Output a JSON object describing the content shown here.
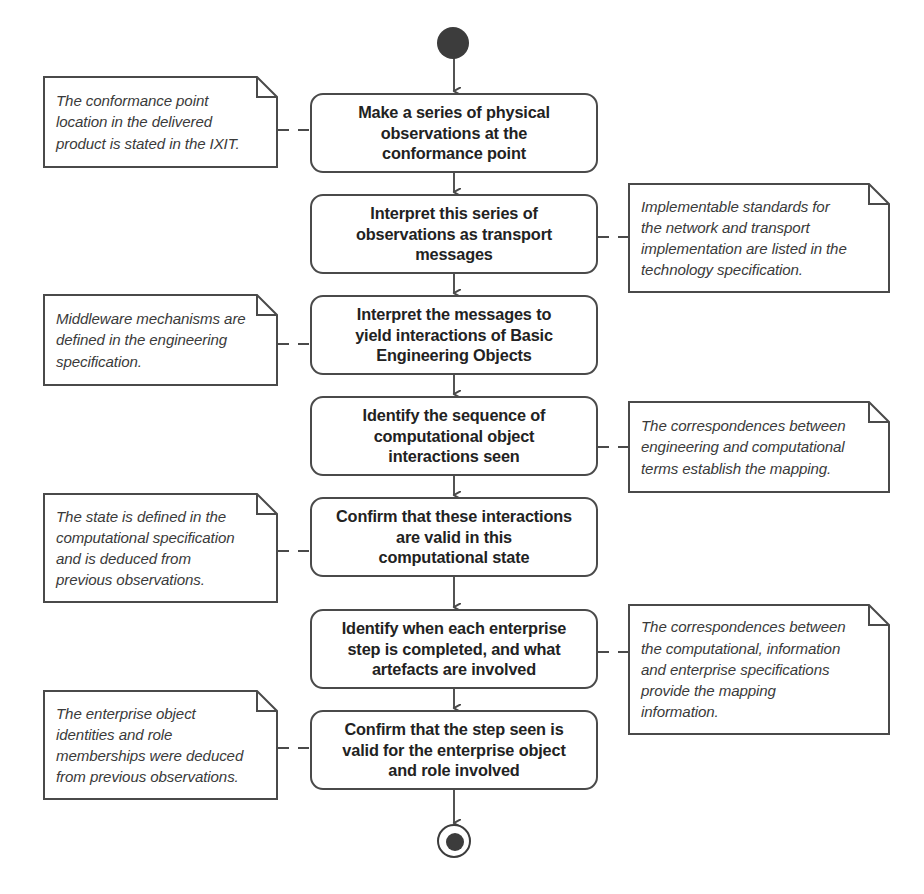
{
  "diagram": {
    "type": "uml-activity-diagram",
    "canvas": {
      "width": 924,
      "height": 894
    },
    "colors": {
      "stroke": "#4a4a4a",
      "text": "#222222",
      "note_text": "#3a3a3a",
      "node_fill": "#3c3c3c",
      "background": "#ffffff"
    },
    "start_node": {
      "name": "initial-node"
    },
    "end_node": {
      "name": "final-node"
    },
    "actions": [
      {
        "id": "action-1",
        "label": "Make a series of physical\nobservations at the\nconformance point",
        "x": 310,
        "y": 93,
        "width": 288,
        "height": 80
      },
      {
        "id": "action-2",
        "label": "Interpret this series of\nobservations as transport\nmessages",
        "x": 310,
        "y": 194,
        "width": 288,
        "height": 80
      },
      {
        "id": "action-3",
        "label": "Interpret the messages to\nyield interactions of Basic\nEngineering Objects",
        "x": 310,
        "y": 295,
        "width": 288,
        "height": 80
      },
      {
        "id": "action-4",
        "label": "Identify the sequence of\ncomputational object\ninteractions seen",
        "x": 310,
        "y": 396,
        "width": 288,
        "height": 80
      },
      {
        "id": "action-5",
        "label": "Confirm that these interactions\nare valid in this\ncomputational state",
        "x": 310,
        "y": 497,
        "width": 288,
        "height": 80
      },
      {
        "id": "action-6",
        "label": "Identify when each enterprise\nstep is completed, and what\nartefacts are involved",
        "x": 310,
        "y": 609,
        "width": 288,
        "height": 80
      },
      {
        "id": "action-7",
        "label": "Confirm that the step seen is\nvalid for the enterprise object\nand role involved",
        "x": 310,
        "y": 710,
        "width": 288,
        "height": 80
      }
    ],
    "notes": [
      {
        "id": "note-1",
        "side": "left",
        "attached_to": "action-1",
        "text": "The conformance point\nlocation in the delivered\nproduct is stated in the IXIT.",
        "x": 43,
        "y": 76,
        "width": 235,
        "height": 92
      },
      {
        "id": "note-2",
        "side": "right",
        "attached_to": "action-2",
        "text": "Implementable standards for\nthe network and transport\nimplementation are listed in the\ntechnology specification.",
        "x": 628,
        "y": 183,
        "width": 262,
        "height": 110
      },
      {
        "id": "note-3",
        "side": "left",
        "attached_to": "action-3",
        "text": "Middleware mechanisms are\ndefined in the engineering\nspecification.",
        "x": 43,
        "y": 294,
        "width": 235,
        "height": 92
      },
      {
        "id": "note-4",
        "side": "right",
        "attached_to": "action-4",
        "text": "The correspondences between\nengineering and computational\nterms establish the mapping.",
        "x": 628,
        "y": 401,
        "width": 262,
        "height": 92
      },
      {
        "id": "note-5",
        "side": "left",
        "attached_to": "action-5",
        "text": "The state is defined in the\ncomputational specification\nand is deduced from\nprevious observations.",
        "x": 43,
        "y": 493,
        "width": 235,
        "height": 110
      },
      {
        "id": "note-6",
        "side": "right",
        "attached_to": "action-6",
        "text": "The correspondences between\nthe computational, information\nand enterprise specifications\nprovide the mapping\ninformation.",
        "x": 628,
        "y": 604,
        "width": 262,
        "height": 131
      },
      {
        "id": "note-7",
        "side": "left",
        "attached_to": "action-7",
        "text": "The enterprise object\nidentities and role\nmemberships were deduced\nfrom previous observations.",
        "x": 43,
        "y": 690,
        "width": 235,
        "height": 110
      }
    ]
  }
}
